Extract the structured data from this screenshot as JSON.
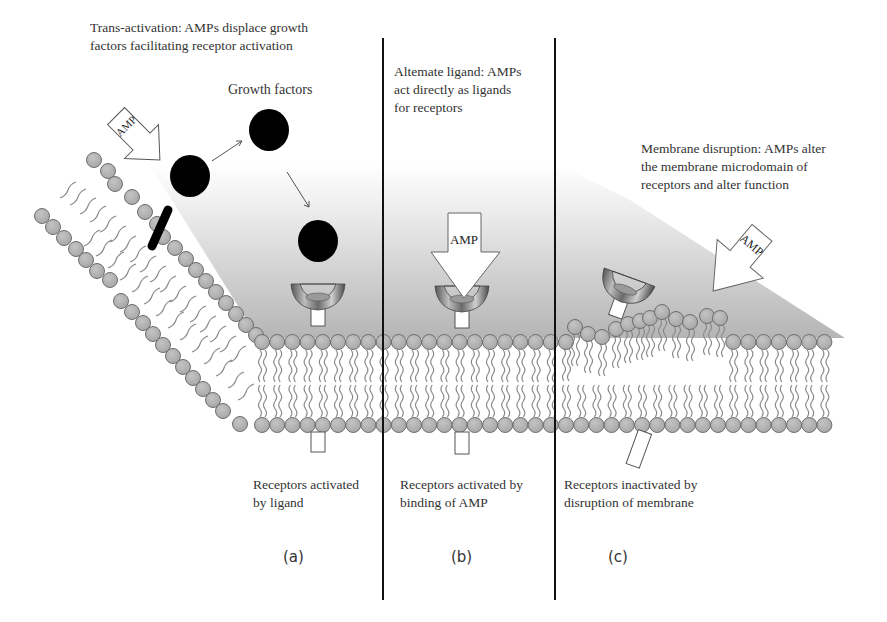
{
  "figure": {
    "panels": [
      {
        "id": "a",
        "label": "(a)",
        "title": "Trans-activation: AMPs displace growth\nfactors facilitating receptor activation",
        "caption": "Receptors activated\nby ligand",
        "growth_factors_label": "Growth factors",
        "amp_label": "AMP"
      },
      {
        "id": "b",
        "label": "(b)",
        "title": "Altemate ligand: AMPs\nact directly as ligands\nfor receptors",
        "caption": "Receptors activated by\nbinding of AMP",
        "amp_label": "AMP"
      },
      {
        "id": "c",
        "label": "(c)",
        "title": "Membrane disruption: AMPs alter\nthe membrane microdomain of\nreceptors and alter function",
        "caption": "Receptors inactivated by\ndisruption of membrane",
        "amp_label": "AMP"
      }
    ],
    "colors": {
      "lipid_head_fill": "#b3b3b3",
      "lipid_head_stroke": "#6e6e6e",
      "lipid_tail": "#8a8a8a",
      "growth_factor": "#000000",
      "divider": "#111111",
      "extracellular_gradient_top": "#ffffff",
      "extracellular_gradient_bottom": "#b8b8b8"
    },
    "divider_x": [
      383,
      555
    ]
  }
}
